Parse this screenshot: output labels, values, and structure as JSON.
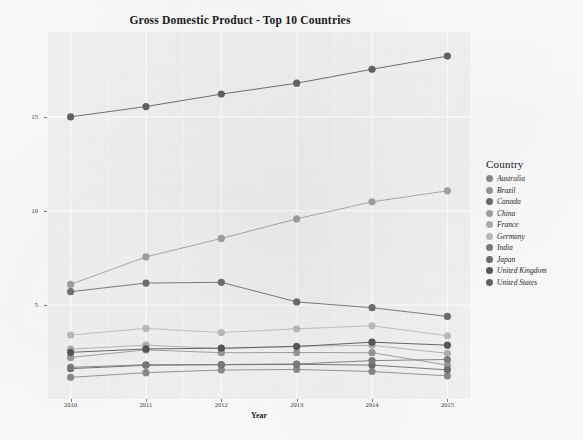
{
  "chart_data": {
    "type": "line",
    "title": "Gross Domestic Product - Top 10 Countries",
    "xlabel": "Year",
    "ylabel": "GDP (in trillion USD)",
    "categories": [
      "2010",
      "2011",
      "2012",
      "2013",
      "2014",
      "2015"
    ],
    "x": [
      2010,
      2011,
      2012,
      2013,
      2014,
      2015
    ],
    "xlim": [
      2009.7,
      2015.3
    ],
    "ylim": [
      0,
      19.5
    ],
    "y_ticks": [
      "5",
      "10",
      "15"
    ],
    "y_tick_values": [
      5,
      10,
      15
    ],
    "x_ticks": [
      "2010",
      "2011",
      "2012",
      "2013",
      "2014",
      "2015"
    ],
    "grid": true,
    "legend_position": "right",
    "legend_title": "Country",
    "marker": "filled-circle",
    "series": [
      {
        "name": "Australia",
        "color": "#8c8c8c",
        "values": [
          1.15,
          1.4,
          1.54,
          1.57,
          1.46,
          1.23
        ]
      },
      {
        "name": "Brazil",
        "color": "#999999",
        "values": [
          2.21,
          2.61,
          2.46,
          2.47,
          2.46,
          1.8
        ]
      },
      {
        "name": "Canada",
        "color": "#6e6e6e",
        "values": [
          1.61,
          1.79,
          1.82,
          1.84,
          1.8,
          1.55
        ]
      },
      {
        "name": "China",
        "color": "#a3a3a3",
        "values": [
          6.09,
          7.55,
          8.53,
          9.57,
          10.48,
          11.06
        ]
      },
      {
        "name": "France",
        "color": "#b0b0b0",
        "values": [
          2.65,
          2.86,
          2.68,
          2.81,
          2.85,
          2.43
        ]
      },
      {
        "name": "Germany",
        "color": "#bdbdbd",
        "values": [
          3.4,
          3.75,
          3.53,
          3.73,
          3.89,
          3.36
        ]
      },
      {
        "name": "India",
        "color": "#7c7c7c",
        "values": [
          1.68,
          1.82,
          1.83,
          1.86,
          2.04,
          2.1
        ]
      },
      {
        "name": "Japan",
        "color": "#707070",
        "values": [
          5.7,
          6.16,
          6.2,
          5.16,
          4.85,
          4.39
        ]
      },
      {
        "name": "United Kingdom",
        "color": "#585858",
        "values": [
          2.48,
          2.66,
          2.7,
          2.79,
          3.02,
          2.86
        ]
      },
      {
        "name": "United States",
        "color": "#646464",
        "values": [
          14.99,
          15.54,
          16.2,
          16.78,
          17.52,
          18.22
        ]
      }
    ]
  },
  "chart": {
    "title": "Gross Domestic Product - Top 10 Countries",
    "x_axis_title": "Year",
    "y_axis_title": "GDP (in trillion USD)"
  },
  "legend": {
    "title": "Country",
    "items": [
      {
        "label": "Australia",
        "color": "#8c8c8c"
      },
      {
        "label": "Brazil",
        "color": "#999999"
      },
      {
        "label": "Canada",
        "color": "#6e6e6e"
      },
      {
        "label": "China",
        "color": "#a3a3a3"
      },
      {
        "label": "France",
        "color": "#b0b0b0"
      },
      {
        "label": "Germany",
        "color": "#bdbdbd"
      },
      {
        "label": "India",
        "color": "#7c7c7c"
      },
      {
        "label": "Japan",
        "color": "#707070"
      },
      {
        "label": "United Kingdom",
        "color": "#585858"
      },
      {
        "label": "United States",
        "color": "#646464"
      }
    ]
  },
  "theme": {
    "panel_background": "#f4f4f4",
    "page_background": "#fdfdfd",
    "grid_major_color": "#ffffff",
    "grid_minor_color": "#fafafa",
    "text_color": "#1b1b1b"
  }
}
